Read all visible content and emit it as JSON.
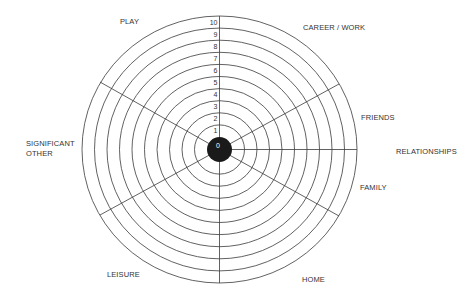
{
  "diagram": {
    "type": "wheel-of-life",
    "center_value": "0",
    "scale": [
      "1",
      "2",
      "3",
      "4",
      "5",
      "6",
      "7",
      "8",
      "9",
      "10"
    ],
    "colors": {
      "lines": "#3a3a3a",
      "hub": "#1a1a1a",
      "text": "#333333",
      "background": "#ffffff"
    },
    "segments": [
      {
        "id": "play",
        "lines": [
          "PLAY"
        ]
      },
      {
        "id": "career",
        "lines": [
          "CAREER / WORK"
        ]
      },
      {
        "id": "friends",
        "lines": [
          "FRIENDS"
        ]
      },
      {
        "id": "relationships",
        "lines": [
          "RELATIONSHIPS"
        ]
      },
      {
        "id": "family",
        "lines": [
          "FAMILY"
        ]
      },
      {
        "id": "home",
        "lines": [
          "HOME"
        ]
      },
      {
        "id": "leisure",
        "lines": [
          "LEISURE"
        ]
      },
      {
        "id": "significant-other",
        "lines": [
          "SIGNIFICANT",
          "OTHER"
        ]
      }
    ]
  }
}
